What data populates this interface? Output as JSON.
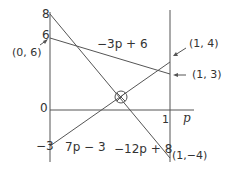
{
  "diagram": {
    "colors": {
      "line": "#555555",
      "text": "#333333",
      "background": "#ffffff"
    },
    "axis": {
      "x_label": "p",
      "tick_x_1": "1",
      "tick_y_8": "8",
      "tick_y_6": "6",
      "tick_y_0": "0",
      "tick_y_neg3": "−3"
    },
    "lines": [
      {
        "id": "line-a",
        "label": "−3p + 6",
        "from": [
          0,
          6
        ],
        "to": [
          1,
          3
        ]
      },
      {
        "id": "line-b",
        "label": "7p − 3",
        "from": [
          0,
          -3
        ],
        "to": [
          1,
          4
        ]
      },
      {
        "id": "line-c",
        "label": "−12p + 8",
        "from": [
          0,
          8
        ],
        "to": [
          1,
          -4
        ]
      }
    ],
    "points": {
      "p06": "(0, 6)",
      "p14": "(1, 4)",
      "p13": "(1, 3)",
      "p1m4": "(1,−4)"
    },
    "marker": "circled-cross at intersection of 7p − 3 and −12p + 8"
  }
}
